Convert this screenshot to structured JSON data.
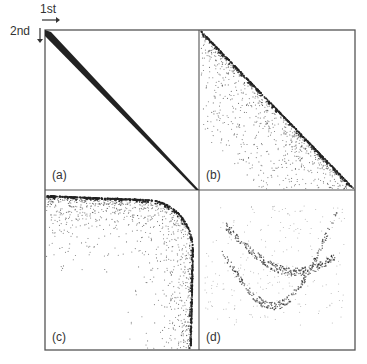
{
  "axes": {
    "first_label": "1st",
    "second_label": "2nd"
  },
  "panels": [
    {
      "id": "a",
      "label": "(a)",
      "description": "tight diagonal line from top-left to bottom-right"
    },
    {
      "id": "b",
      "label": "(b)",
      "description": "diagonal line with scatter below-left"
    },
    {
      "id": "c",
      "label": "(c)",
      "description": "rounded corner curve with scatter inside"
    },
    {
      "id": "d",
      "label": "(d)",
      "description": "sparse curved bands of points"
    }
  ],
  "colors": {
    "frame": "#555555",
    "points": "#222222"
  }
}
